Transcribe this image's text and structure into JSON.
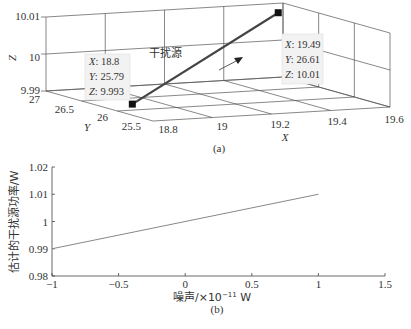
{
  "chart_data": [
    {
      "type": "line3d",
      "panel_label": "(a)",
      "xlabel": "X",
      "ylabel": "Y",
      "zlabel": "Z",
      "x_ticks": [
        "18.8",
        "19",
        "19.2",
        "19.4",
        "19.6"
      ],
      "y_ticks": [
        "25.5",
        "26",
        "26.5",
        "27"
      ],
      "z_ticks": [
        "9.99",
        "10",
        "10.01"
      ],
      "xlim": [
        18.8,
        19.6
      ],
      "ylim": [
        25.5,
        27
      ],
      "zlim": [
        9.99,
        10.01
      ],
      "grid": true,
      "series": [
        {
          "name": "干扰源",
          "points": [
            {
              "x": 18.8,
              "y": 25.79,
              "z": 9.993
            },
            {
              "x": 19.49,
              "y": 26.61,
              "z": 10.01
            }
          ],
          "color": "#444444"
        }
      ],
      "annotations": [
        {
          "text": "干扰源",
          "type": "label"
        },
        {
          "type": "arrow",
          "direction": "toward-end"
        }
      ],
      "datatips": [
        {
          "lines": [
            "X: 18.8",
            "Y: 25.79",
            "Z: 9.993"
          ]
        },
        {
          "lines": [
            "X: 19.49",
            "Y: 26.61",
            "Z: 10.01"
          ]
        }
      ]
    },
    {
      "type": "line",
      "panel_label": "(b)",
      "title": "",
      "xlabel": "噪声/×10⁻¹¹ W",
      "ylabel": "估计的干扰源功率/W",
      "x_ticks": [
        "−1",
        "−0.5",
        "0",
        "0.5",
        "1",
        "1.5"
      ],
      "y_ticks": [
        "0.98",
        "0.99",
        "1",
        "1.01",
        "1.02"
      ],
      "xlim": [
        -1,
        1.5
      ],
      "ylim": [
        0.98,
        1.02
      ],
      "grid": false,
      "series": [
        {
          "name": "estimated power",
          "x": [
            -1,
            1
          ],
          "y": [
            0.99,
            1.01
          ],
          "color": "#888888"
        }
      ]
    }
  ],
  "labels": {
    "xlabel_prefix": "噪声/×10",
    "xlabel_exp": "−11",
    "xlabel_unit": " W",
    "tip1": {
      "x_key": "X",
      "x_val": ": 18.8",
      "y_key": "Y",
      "y_val": ": 25.79",
      "z_key": "Z",
      "z_val": ": 9.993"
    },
    "tip2": {
      "x_key": "X",
      "x_val": ": 19.49",
      "y_key": "Y",
      "y_val": ": 26.61",
      "z_key": "Z",
      "z_val": ": 10.01"
    }
  }
}
